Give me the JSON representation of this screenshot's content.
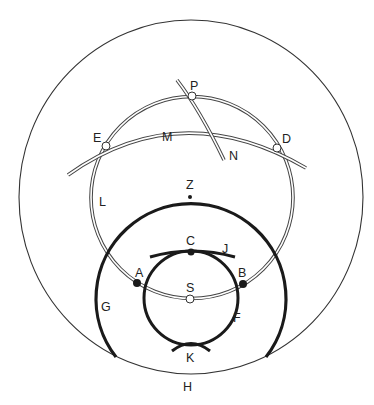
{
  "diagram": {
    "type": "geometric construction of circles and arcs",
    "colors": {
      "background": "#ffffff",
      "line": "#333333",
      "thick_line": "#1a1a1a",
      "open_point_fill": "#ffffff",
      "filled_point_fill": "#1a1a1a"
    },
    "labels": {
      "P": "P",
      "E": "E",
      "D": "D",
      "M": "M",
      "N": "N",
      "L": "L",
      "Z": "Z",
      "C": "C",
      "J": "J",
      "A": "A",
      "B": "B",
      "S": "S",
      "G": "G",
      "F": "F",
      "K": "K",
      "H": "H"
    },
    "curves": [
      {
        "id": "H",
        "kind": "outer circle",
        "style": "thin"
      },
      {
        "id": "L",
        "kind": "circle",
        "style": "double line"
      },
      {
        "id": "M",
        "kind": "arc",
        "style": "double line"
      },
      {
        "id": "N",
        "kind": "arc",
        "style": "double line"
      },
      {
        "id": "G",
        "kind": "arc of circle cut by H",
        "style": "thick"
      },
      {
        "id": "F",
        "kind": "circle",
        "style": "thick"
      },
      {
        "id": "J",
        "kind": "short arc",
        "style": "thick"
      },
      {
        "id": "K",
        "kind": "short arc",
        "style": "thick"
      }
    ],
    "points": [
      {
        "id": "P",
        "style": "open"
      },
      {
        "id": "E",
        "style": "open"
      },
      {
        "id": "D",
        "style": "open"
      },
      {
        "id": "S",
        "style": "open"
      },
      {
        "id": "A",
        "style": "filled"
      },
      {
        "id": "B",
        "style": "filled"
      },
      {
        "id": "C",
        "style": "filled"
      },
      {
        "id": "Z",
        "style": "small dot"
      }
    ]
  }
}
